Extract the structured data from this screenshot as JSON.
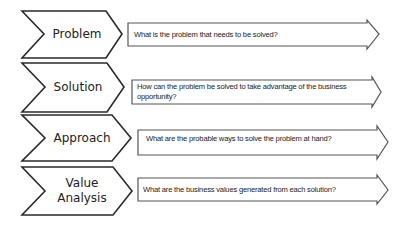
{
  "diagram": {
    "type": "process-steps",
    "colors": {
      "stroke": "#2a2a2a",
      "fill": "#ffffff",
      "text": "#222222"
    },
    "steps": [
      {
        "label": "Problem",
        "question": "What is the problem that needs to be  solved?"
      },
      {
        "label": "Solution",
        "question_line1": "How can the problem be solved to take  advantage of the business",
        "question_line2": "opportunity?"
      },
      {
        "label": "Approach",
        "question": "What are the probable ways to solve the problem at hand?"
      },
      {
        "label_line1": "Value",
        "label_line2": "Analysis",
        "question": "What are the business values generated from each solution?"
      }
    ]
  }
}
